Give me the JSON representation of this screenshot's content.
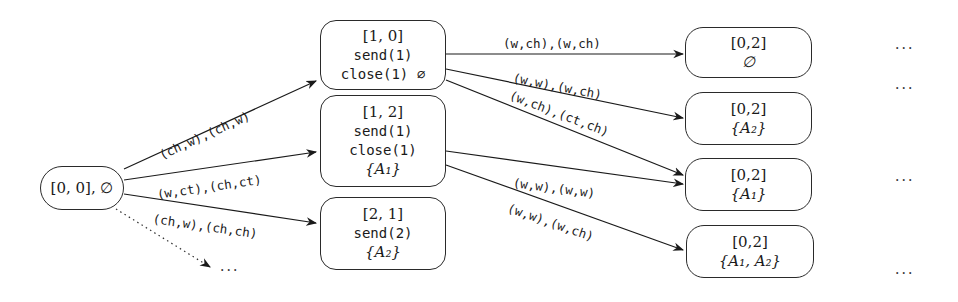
{
  "diagram": {
    "type": "state-transition-tree",
    "root": {
      "id": "n00",
      "state": "[0, 0], ∅"
    },
    "level1": [
      {
        "id": "n10",
        "state": "[1, 0]",
        "lines": [
          "send(1)",
          "close(1) ∅"
        ]
      },
      {
        "id": "n12",
        "state": "[1, 2]",
        "lines": [
          "send(1)",
          "close(1)",
          "{A₁}"
        ]
      },
      {
        "id": "n21",
        "state": "[2, 1]",
        "lines": [
          "send(2)",
          "{A₂}"
        ]
      }
    ],
    "level2": [
      {
        "id": "m1",
        "state": "[0,2]",
        "set": "∅"
      },
      {
        "id": "m2",
        "state": "[0,2]",
        "set": "{A₂}"
      },
      {
        "id": "m3",
        "state": "[0,2]",
        "set": "{A₁}"
      },
      {
        "id": "m4",
        "state": "[0,2]",
        "set": "{A₁, A₂}"
      }
    ],
    "edges": [
      {
        "from": "n00",
        "to": "n10",
        "label": "(ch,w),(ch,w)"
      },
      {
        "from": "n00",
        "to": "n12",
        "label": "(w,ct),(ch,ct)"
      },
      {
        "from": "n00",
        "to": "n21",
        "label": "(ch,w),(ch,ch)"
      },
      {
        "from": "n00",
        "to": "more",
        "label": "",
        "style": "dotted"
      },
      {
        "from": "n10",
        "to": "m1",
        "label": "(w,ch),(w,ch)"
      },
      {
        "from": "n10",
        "to": "m2",
        "label": "(w,w),(w,ch)"
      },
      {
        "from": "n10",
        "to": "m3",
        "label": "(w,ch),(ct,ch)"
      },
      {
        "from": "n12",
        "to": "m3",
        "label": "(w,w),(w,w)"
      },
      {
        "from": "n12",
        "to": "m4",
        "label": "(w,w),(w,ch)"
      }
    ],
    "ellipsis": "···"
  }
}
